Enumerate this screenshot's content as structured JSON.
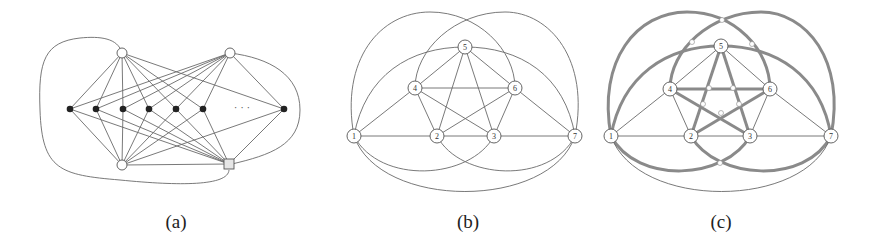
{
  "figure": {
    "panels": [
      {
        "id": "a",
        "caption": "(a)",
        "ellipsis": "· · ·",
        "top_nodes": [
          {
            "x": 122,
            "y": 53
          },
          {
            "x": 230,
            "y": 53
          }
        ],
        "bottom_circle_node": {
          "x": 122,
          "y": 165
        },
        "bottom_square_node": {
          "x": 229,
          "y": 164
        },
        "middle_nodes_x": [
          70,
          96,
          123,
          149,
          176,
          203,
          284
        ],
        "middle_y": 109
      },
      {
        "id": "b",
        "caption": "(b)",
        "nodes": [
          {
            "label": "1",
            "x": 354,
            "y": 136
          },
          {
            "label": "2",
            "x": 437,
            "y": 136
          },
          {
            "label": "3",
            "x": 494,
            "y": 136
          },
          {
            "label": "4",
            "x": 415,
            "y": 88
          },
          {
            "label": "5",
            "x": 465,
            "y": 47
          },
          {
            "label": "6",
            "x": 515,
            "y": 88
          },
          {
            "label": "7",
            "x": 575,
            "y": 136
          }
        ]
      },
      {
        "id": "c",
        "caption": "(c)",
        "nodes": [
          {
            "label": "1",
            "x": 611,
            "y": 136
          },
          {
            "label": "2",
            "x": 691,
            "y": 136
          },
          {
            "label": "3",
            "x": 750,
            "y": 136
          },
          {
            "label": "4",
            "x": 670,
            "y": 89
          },
          {
            "label": "5",
            "x": 721,
            "y": 46
          },
          {
            "label": "6",
            "x": 770,
            "y": 89
          },
          {
            "label": "7",
            "x": 831,
            "y": 136
          }
        ],
        "highlight_color": "#8a8a8a"
      }
    ]
  }
}
